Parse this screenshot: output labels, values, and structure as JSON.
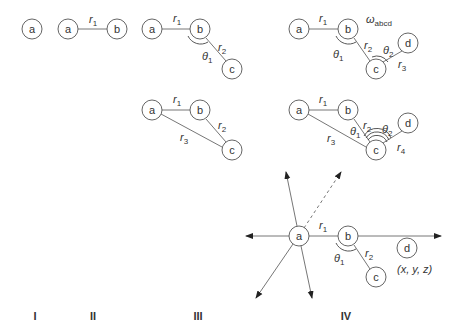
{
  "panels": {
    "I": {
      "label": "I",
      "nodes": [
        "a"
      ]
    },
    "II": {
      "label": "II",
      "nodes": [
        "a",
        "b"
      ],
      "bond": "r1"
    },
    "III_top": {
      "nodes": [
        "a",
        "b",
        "c"
      ],
      "bonds": [
        "r1",
        "r2"
      ],
      "angle": "θ1"
    },
    "III_mid": {
      "nodes": [
        "a",
        "b",
        "c"
      ],
      "distances": [
        "r1",
        "r2",
        "r3"
      ]
    },
    "IV_top": {
      "nodes": [
        "a",
        "b",
        "c",
        "d"
      ],
      "bonds": [
        "r1",
        "r2",
        "r3"
      ],
      "angles": [
        "θ1",
        "θ2"
      ],
      "dihedral": "ωabcd"
    },
    "IV_mid": {
      "nodes": [
        "a",
        "b",
        "c",
        "d"
      ],
      "distances": [
        "r1",
        "r2",
        "r3",
        "r4"
      ],
      "angles": [
        "θ1",
        "θ2"
      ]
    },
    "IV_bottom": {
      "nodes": [
        "a",
        "b",
        "c",
        "d"
      ],
      "bonds": [
        "r1",
        "r2"
      ],
      "angle": "θ1",
      "coordinate": "(x, y, z)"
    }
  },
  "node_labels": {
    "a": "a",
    "b": "b",
    "c": "c",
    "d": "d"
  },
  "labels": {
    "r": "r",
    "theta": "θ",
    "omega": "ω",
    "omega_sub": "abcd",
    "sub1": "1",
    "sub2": "2",
    "sub3": "3",
    "sub4": "4",
    "coord": "(x, y, z)"
  },
  "roman": [
    "I",
    "II",
    "III",
    "IV"
  ]
}
